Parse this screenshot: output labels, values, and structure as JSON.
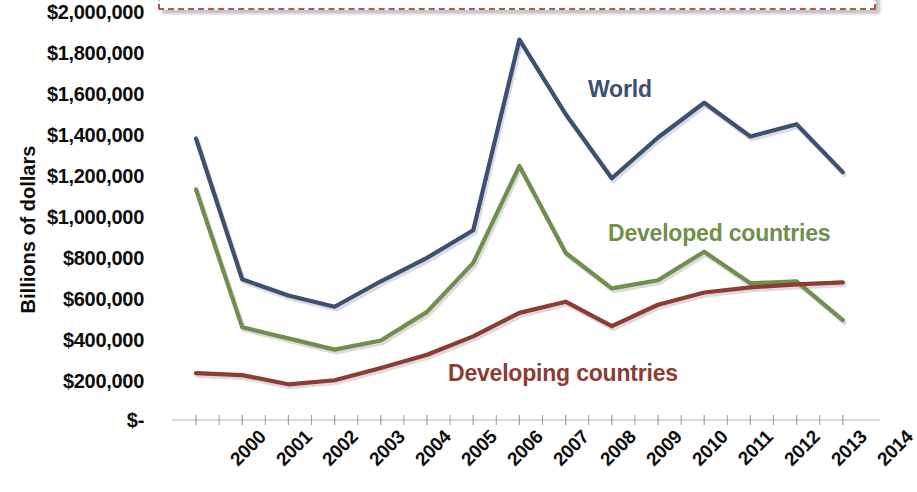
{
  "annotation": {
    "text": "FDI in developed countries for the first time.",
    "border_color": "#b4564f",
    "clipped": "true"
  },
  "axis": {
    "y_title": "Billions of dollars",
    "y_ticks": [
      "$2,000,000",
      "$1,800,000",
      "$1,600,000",
      "$1,400,000",
      "$1,200,000",
      "$1,000,000",
      "$800,000",
      "$600,000",
      "$400,000",
      "$200,000",
      "$-"
    ],
    "x_ticks": [
      "2000",
      "2001",
      "2002",
      "2003",
      "2004",
      "2005",
      "2006",
      "2007",
      "2008",
      "2009",
      "2010",
      "2011",
      "2012",
      "2013",
      "2014"
    ]
  },
  "series_labels": [
    {
      "name": "World",
      "color": "#3a5173"
    },
    {
      "name": "Developed countries",
      "color": "#6f8f4a"
    },
    {
      "name": "Developing countries",
      "color": "#8d3b33"
    }
  ],
  "chart_data": {
    "type": "line",
    "title": "",
    "xlabel": "",
    "ylabel": "Billions of dollars",
    "x": [
      2000,
      2001,
      2002,
      2003,
      2004,
      2005,
      2006,
      2007,
      2008,
      2009,
      2010,
      2011,
      2012,
      2013,
      2014
    ],
    "ylim": [
      0,
      2000000
    ],
    "ytick_step": 200000,
    "grid": "false",
    "legend": "inline-series-labels",
    "series": [
      {
        "name": "World",
        "color": "#3a5173",
        "values": [
          1380000,
          690000,
          610000,
          555000,
          680000,
          795000,
          930000,
          1865000,
          1500000,
          1185000,
          1385000,
          1555000,
          1390000,
          1450000,
          1215000
        ]
      },
      {
        "name": "Developed countries",
        "color": "#6f8f4a",
        "values": [
          1130000,
          455000,
          400000,
          345000,
          390000,
          530000,
          770000,
          1245000,
          820000,
          645000,
          685000,
          825000,
          670000,
          680000,
          490000
        ]
      },
      {
        "name": "Developing countries",
        "color": "#8d3b33",
        "values": [
          230000,
          220000,
          175000,
          195000,
          255000,
          320000,
          410000,
          525000,
          580000,
          460000,
          565000,
          625000,
          650000,
          665000,
          675000
        ]
      }
    ]
  }
}
